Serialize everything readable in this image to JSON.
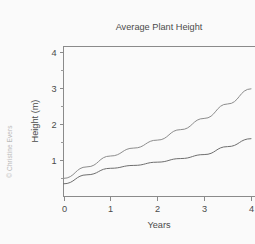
{
  "watermark": {
    "text": "© Christine Evers"
  },
  "chart_data": {
    "type": "line",
    "title": "Average Plant Height",
    "xlabel": "Years",
    "ylabel": "Height (m)",
    "xlim": [
      0,
      4.1
    ],
    "ylim": [
      0,
      4.15
    ],
    "xticks": [
      0,
      1,
      2,
      3,
      4
    ],
    "xtick_labels": [
      "0",
      "1",
      "2",
      "3",
      "4"
    ],
    "yticks": [
      1,
      2,
      3,
      4
    ],
    "ytick_labels": [
      "1",
      "2",
      "3",
      "4"
    ],
    "yticks_minor": [
      0.5,
      1.5,
      2.5,
      3.5
    ],
    "grid": false,
    "legend": "none",
    "note": "right edge of plot is cropped at x = 4",
    "series": [
      {
        "name": "upper-curve",
        "color": "#8c8c8c",
        "x": [
          0,
          0.5,
          1,
          1.5,
          2,
          2.5,
          3,
          3.5,
          4
        ],
        "values": [
          0.5,
          0.82,
          1.12,
          1.34,
          1.56,
          1.85,
          2.16,
          2.56,
          2.98
        ]
      },
      {
        "name": "lower-curve",
        "color": "#6e6e6e",
        "x": [
          0,
          0.5,
          1,
          1.5,
          2,
          2.5,
          3,
          3.5,
          4
        ],
        "values": [
          0.35,
          0.6,
          0.78,
          0.86,
          0.95,
          1.05,
          1.16,
          1.38,
          1.6
        ]
      }
    ]
  },
  "colors": {
    "background": "#fafafa",
    "axis": "#8a8a8a",
    "text": "#4a4a4a",
    "watermark": "#b9b9b9"
  }
}
